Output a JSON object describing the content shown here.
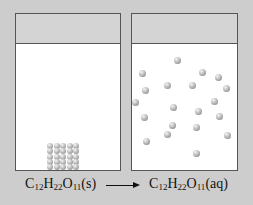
{
  "figure": {
    "background_color": "#cdcdcd",
    "beakers": [
      {
        "name": "solid-beaker",
        "state": "solid",
        "particles_layout": "cube-5x5"
      },
      {
        "name": "solution-beaker",
        "state": "aqueous",
        "particles_layout": "dispersed",
        "particles": [
          [
            177,
            60
          ],
          [
            142,
            73
          ],
          [
            202,
            72
          ],
          [
            218,
            77
          ],
          [
            167,
            85
          ],
          [
            192,
            85
          ],
          [
            145,
            90
          ],
          [
            226,
            88
          ],
          [
            135,
            102
          ],
          [
            173,
            107
          ],
          [
            214,
            101
          ],
          [
            144,
            117
          ],
          [
            198,
            111
          ],
          [
            219,
            116
          ],
          [
            172,
            125
          ],
          [
            167,
            134
          ],
          [
            196,
            127
          ],
          [
            227,
            135
          ],
          [
            146,
            141
          ],
          [
            196,
            153
          ]
        ]
      }
    ],
    "equation": {
      "reactant_formula": "C12H22O11",
      "reactant_state": "(s)",
      "product_formula": "C12H22O11",
      "product_state": "(aq)",
      "arrow": "right-arrow"
    }
  }
}
